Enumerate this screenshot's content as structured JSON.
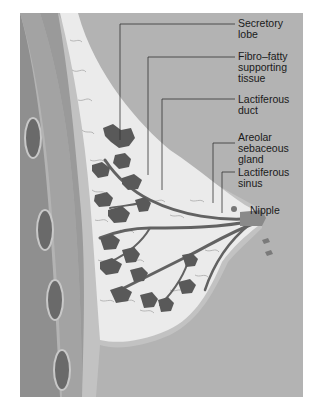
{
  "figure": {
    "background_color": "#b3b3b3",
    "tissue_color": "#e9e9e9",
    "lobe_color": "#5a5a5a",
    "duct_color": "#6e6e6e",
    "labels": [
      {
        "id": "secretory-lobe",
        "text": "Secretory\nlobe"
      },
      {
        "id": "fibro-fatty",
        "text": "Fibro–fatty\nsupporting\ntissue"
      },
      {
        "id": "lactiferous-duct",
        "text": "Lactiferous\nduct"
      },
      {
        "id": "areolar-gland",
        "text": "Areolar\nsebaceous\ngland"
      },
      {
        "id": "lactiferous-sinus",
        "text": "Lactiferous\nsinus"
      },
      {
        "id": "nipple",
        "text": "Nipple"
      }
    ]
  }
}
